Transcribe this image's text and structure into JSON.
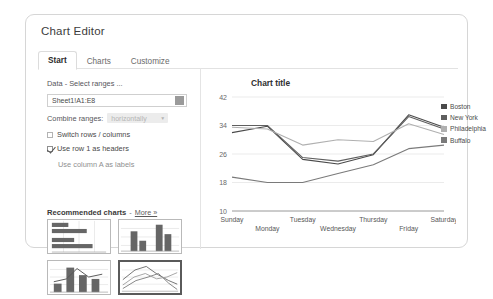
{
  "dialog": {
    "title": "Chart Editor",
    "tabs": [
      {
        "label": "Start",
        "active": true
      },
      {
        "label": "Charts",
        "active": false
      },
      {
        "label": "Customize",
        "active": false
      }
    ]
  },
  "data_section": {
    "heading": "Data - Select ranges ...",
    "range_value": "Sheet1!A1:E8",
    "range_picker_icon": "grid-icon",
    "combine_label": "Combine ranges:",
    "combine_value": "horizontally",
    "combine_caret_icon": "chevron-down-icon",
    "checkboxes": [
      {
        "label": "Switch rows / columns",
        "checked": false,
        "muted": false
      },
      {
        "label": "Use row 1 as headers",
        "checked": true,
        "muted": false
      },
      {
        "label": "Use column A as labels",
        "checked": false,
        "muted": true
      }
    ]
  },
  "recommended": {
    "title": "Recommended charts",
    "dash": "-",
    "more_label": "More »",
    "thumbnails": [
      {
        "name": "bar-chart-thumbnail",
        "type": "bar",
        "selected": false
      },
      {
        "name": "column-chart-thumbnail",
        "type": "column",
        "selected": false
      },
      {
        "name": "combo-chart-thumbnail",
        "type": "combo",
        "selected": false
      },
      {
        "name": "line-chart-thumbnail",
        "type": "line",
        "selected": true
      }
    ]
  },
  "chart_data": {
    "type": "line",
    "title": "Chart title",
    "xlabel": "",
    "ylabel": "",
    "ylim": [
      10,
      42
    ],
    "yticks": [
      42,
      34,
      26,
      18,
      10
    ],
    "grid": true,
    "legend_position": "right",
    "categories": [
      "Sunday",
      "Monday",
      "Tuesday",
      "Wednesday",
      "Thursday",
      "Friday",
      "Saturday"
    ],
    "series": [
      {
        "name": "Boston",
        "color": "#4a4a4a",
        "values": [
          32.0,
          33.8,
          24.5,
          23.2,
          25.8,
          37.0,
          33.5
        ]
      },
      {
        "name": "New York",
        "color": "#5f5f5f",
        "values": [
          34.0,
          34.0,
          25.0,
          24.0,
          26.0,
          36.5,
          33.0
        ]
      },
      {
        "name": "Philadelphia",
        "color": "#b0b0b0",
        "values": [
          33.5,
          33.0,
          28.5,
          30.0,
          29.5,
          34.5,
          31.5
        ]
      },
      {
        "name": "Buffalo",
        "color": "#7a7a7a",
        "values": [
          19.5,
          18.0,
          18.0,
          20.5,
          23.0,
          27.5,
          28.5
        ]
      }
    ]
  },
  "colors": {
    "dialog_border": "#d6d6d6",
    "grid_line": "#e6e6e6",
    "axis_line": "#9a9a9a",
    "text": "#4b4b4b"
  }
}
